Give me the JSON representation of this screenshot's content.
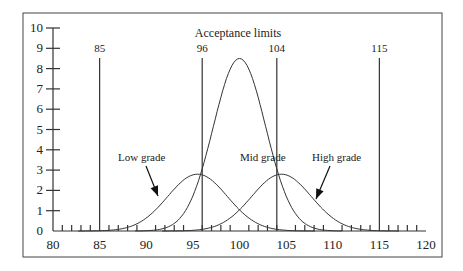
{
  "chart_data": {
    "type": "line",
    "title": "Acceptance limits",
    "xlabel": "",
    "ylabel": "",
    "xlim": [
      80,
      120
    ],
    "ylim": [
      0,
      10
    ],
    "x_ticks": [
      80,
      85,
      90,
      95,
      100,
      105,
      110,
      115,
      120
    ],
    "y_ticks": [
      0,
      1,
      2,
      3,
      4,
      5,
      6,
      7,
      8,
      9,
      10
    ],
    "grid": false,
    "acceptance_limits": [
      {
        "label": "85",
        "x": 85
      },
      {
        "label": "96",
        "x": 96
      },
      {
        "label": "104",
        "x": 104
      },
      {
        "label": "115",
        "x": 115
      }
    ],
    "series": [
      {
        "name": "Low grade",
        "mean": 95.5,
        "peak": 2.8,
        "sd": 3.2
      },
      {
        "name": "Mid grade",
        "mean": 100,
        "peak": 8.5,
        "sd": 2.8
      },
      {
        "name": "High grade",
        "mean": 104.5,
        "peak": 2.8,
        "sd": 3.2
      }
    ],
    "annotations": [
      {
        "text": "Low grade",
        "arrow_to": [
          92,
          1.5
        ]
      },
      {
        "text": "Mid grade"
      },
      {
        "text": "High grade",
        "arrow_to": [
          108,
          1.5
        ]
      }
    ]
  }
}
